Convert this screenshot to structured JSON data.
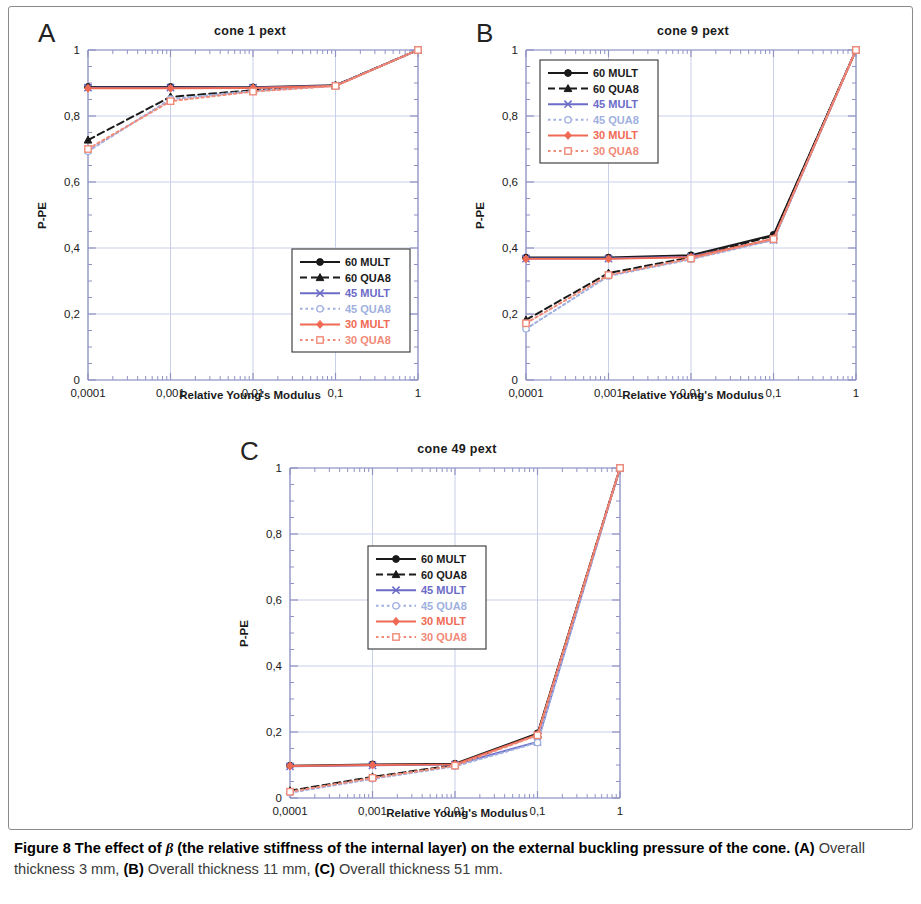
{
  "figure": {
    "caption_lead": "Figure 8 The effect of ",
    "caption_beta": "β",
    "caption_lead2": " (the relative stiffness of the internal layer) on the external buckling pressure of the cone.",
    "caption_a_ref": "(A)",
    "caption_a_text": " Overall thickness 3 mm, ",
    "caption_b_ref": "(B)",
    "caption_b_text": " Overall thickness 11 mm, ",
    "caption_c_ref": "(C)",
    "caption_c_text": " Overall thickness 51 mm."
  },
  "colors": {
    "black": "#1a1a1a",
    "blue": "#6b6bc8",
    "lightblue": "#9fb0e0",
    "red": "#ef6a55",
    "lightred": "#f08a78",
    "grid": "#c9cfe8",
    "axis": "#8f93c4"
  },
  "axes": {
    "x_ticks": [
      "0,0001",
      "0,001",
      "0,01",
      "0,1",
      "1"
    ],
    "y_ticks": [
      "0",
      "0,2",
      "0,4",
      "0,6",
      "0,8",
      "1"
    ],
    "xlabel": "Relative Young's Modulus",
    "ylabel": "P-PE",
    "xlim": [
      0.0001,
      1
    ],
    "ylim": [
      0,
      1
    ],
    "xscale": "log"
  },
  "legend": {
    "entries": [
      {
        "label": "60 MULT",
        "color": "#1a1a1a",
        "dash": "solid",
        "marker": "circle"
      },
      {
        "label": "60 QUA8",
        "color": "#1a1a1a",
        "dash": "dashed",
        "marker": "triangle"
      },
      {
        "label": "45 MULT",
        "color": "#6b6bc8",
        "dash": "solid",
        "marker": "cross"
      },
      {
        "label": "45 QUA8",
        "color": "#9fb0e0",
        "dash": "dotted",
        "marker": "circle-open"
      },
      {
        "label": "30 MULT",
        "color": "#ef6a55",
        "dash": "solid",
        "marker": "diamond"
      },
      {
        "label": "30 QUA8",
        "color": "#f08a78",
        "dash": "dotted",
        "marker": "square"
      }
    ]
  },
  "panels": [
    {
      "letter": "A",
      "title": "cone 1 pext",
      "legend_pos": "bottom-right"
    },
    {
      "letter": "B",
      "title": "cone 9 pext",
      "legend_pos": "top-left"
    },
    {
      "letter": "C",
      "title": "cone 49 pext",
      "legend_pos": "center"
    }
  ],
  "chart_data": [
    {
      "type": "line",
      "panel": "A",
      "title": "cone 1 pext",
      "xlabel": "Relative Young's Modulus",
      "ylabel": "P-PE",
      "xscale": "log",
      "xlim": [
        0.0001,
        1
      ],
      "ylim": [
        0,
        1
      ],
      "grid": true,
      "legend_position": "bottom-right",
      "x": [
        0.0001,
        0.001,
        0.01,
        0.1,
        1
      ],
      "series": [
        {
          "name": "60 MULT",
          "values": [
            0.888,
            0.888,
            0.887,
            0.893,
            1.0
          ]
        },
        {
          "name": "60 QUA8",
          "values": [
            0.727,
            0.858,
            0.878,
            0.893,
            1.0
          ]
        },
        {
          "name": "45 MULT",
          "values": [
            0.886,
            0.886,
            0.886,
            0.892,
            1.0
          ]
        },
        {
          "name": "45 QUA8",
          "values": [
            0.693,
            0.851,
            0.876,
            0.892,
            1.0
          ]
        },
        {
          "name": "30 MULT",
          "values": [
            0.884,
            0.884,
            0.885,
            0.891,
            1.0
          ]
        },
        {
          "name": "30 QUA8",
          "values": [
            0.7,
            0.845,
            0.874,
            0.891,
            1.0
          ]
        }
      ]
    },
    {
      "type": "line",
      "panel": "B",
      "title": "cone 9 pext",
      "xlabel": "Relative Young's Modulus",
      "ylabel": "P-PE",
      "xscale": "log",
      "xlim": [
        0.0001,
        1
      ],
      "ylim": [
        0,
        1
      ],
      "grid": true,
      "legend_position": "top-left",
      "x": [
        0.0001,
        0.001,
        0.01,
        0.1,
        1
      ],
      "series": [
        {
          "name": "60 MULT",
          "values": [
            0.371,
            0.371,
            0.378,
            0.44,
            1.0
          ]
        },
        {
          "name": "60 QUA8",
          "values": [
            0.182,
            0.324,
            0.372,
            0.437,
            1.0
          ]
        },
        {
          "name": "45 MULT",
          "values": [
            0.368,
            0.368,
            0.374,
            0.425,
            1.0
          ]
        },
        {
          "name": "45 QUA8",
          "values": [
            0.155,
            0.315,
            0.366,
            0.424,
            1.0
          ]
        },
        {
          "name": "30 MULT",
          "values": [
            0.367,
            0.367,
            0.372,
            0.428,
            1.0
          ]
        },
        {
          "name": "30 QUA8",
          "values": [
            0.172,
            0.318,
            0.368,
            0.427,
            1.0
          ]
        }
      ]
    },
    {
      "type": "line",
      "panel": "C",
      "title": "cone 49 pext",
      "xlabel": "Relative Young's Modulus",
      "ylabel": "P-PE",
      "xscale": "log",
      "xlim": [
        0.0001,
        1
      ],
      "ylim": [
        0,
        1
      ],
      "grid": true,
      "legend_position": "center",
      "x": [
        0.0001,
        0.001,
        0.01,
        0.1,
        1
      ],
      "series": [
        {
          "name": "60 MULT",
          "values": [
            0.098,
            0.102,
            0.104,
            0.196,
            1.0
          ]
        },
        {
          "name": "60 QUA8",
          "values": [
            0.022,
            0.064,
            0.1,
            0.193,
            1.0
          ]
        },
        {
          "name": "45 MULT",
          "values": [
            0.096,
            0.099,
            0.101,
            0.17,
            1.0
          ]
        },
        {
          "name": "45 QUA8",
          "values": [
            0.016,
            0.058,
            0.096,
            0.168,
            1.0
          ]
        },
        {
          "name": "30 MULT",
          "values": [
            0.097,
            0.1,
            0.102,
            0.192,
            1.0
          ]
        },
        {
          "name": "30 QUA8",
          "values": [
            0.019,
            0.061,
            0.098,
            0.19,
            1.0
          ]
        }
      ]
    }
  ]
}
